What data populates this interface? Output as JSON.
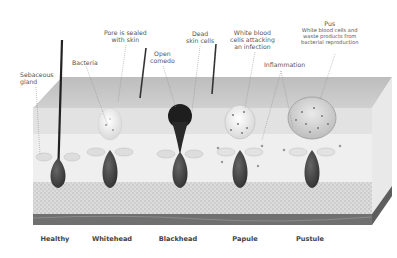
{
  "diagram": {
    "type": "acne-formation-cross-section",
    "annotations": {
      "sebaceous_gland": [
        "Sebaceous",
        "gland"
      ],
      "bacteria": "Bacteria",
      "pore_sealed": [
        "Pore is sealed",
        "with skin"
      ],
      "open_comedo": [
        "Open",
        "comedo"
      ],
      "dead_skin_cells": [
        "Dead",
        "skin cells"
      ],
      "white_blood_cells": [
        "White blood",
        "cells attacking",
        "an infection"
      ],
      "inflammation": "Inflammation",
      "pus_title": "Pus",
      "pus_desc": [
        "White blood cells and",
        "waste products from",
        "bacterial reproduction"
      ]
    },
    "stages": [
      {
        "label": "Healthy",
        "x": 55
      },
      {
        "label": "Whitehead",
        "x": 112
      },
      {
        "label": "Blackhead",
        "x": 178
      },
      {
        "label": "Papule",
        "x": 245
      },
      {
        "label": "Pustule",
        "x": 310
      }
    ],
    "colors": {
      "skin_top": "#c8c8c8",
      "epidermis": "#e4e4e4",
      "dermis": "#ededed",
      "fat": "#d6d6d6",
      "base_band": "#6e6e6e",
      "follicle": "#3a3a3a",
      "blackhead": "#1a1a1a",
      "whitehead": "#f4f4f4"
    }
  }
}
